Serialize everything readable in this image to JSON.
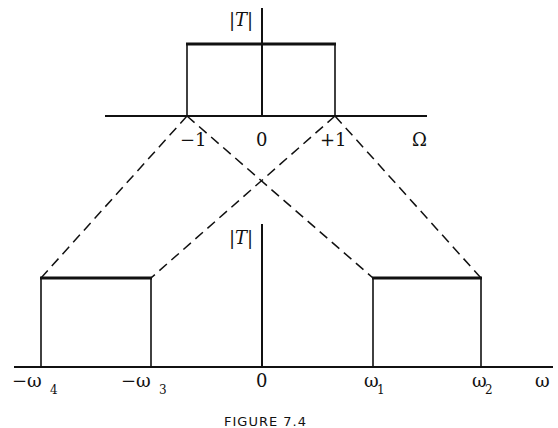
{
  "figure": {
    "caption": "FIGURE 7.4",
    "top_plot": {
      "ylabel": "|T|",
      "xlabel": "Ω",
      "ticks": [
        "−1",
        "0",
        "+1"
      ],
      "passband": {
        "from": -1,
        "to": 1
      }
    },
    "bottom_plot": {
      "ylabel": "|T|",
      "xlabel": "ω",
      "ticks": {
        "neg_w4": {
          "sign": "−",
          "sym": "ω",
          "sub": "4"
        },
        "neg_w3": {
          "sign": "−",
          "sym": "ω",
          "sub": "3"
        },
        "zero": "0",
        "w1": {
          "sym": "ω",
          "sub": "1"
        },
        "w2": {
          "sym": "ω",
          "sub": "2"
        }
      },
      "passbands": [
        {
          "from": "−ω4",
          "to": "−ω3"
        },
        {
          "from": "ω1",
          "to": "ω2"
        }
      ]
    },
    "mapping": "Dashed lines map Ω = −1 → −ω3 and ω2; Ω = +1 → −ω4 and ω1"
  }
}
